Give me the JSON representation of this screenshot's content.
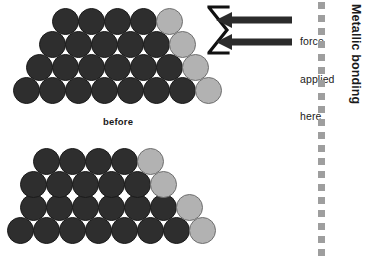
{
  "figure": {
    "title_side_label": "Metallic bonding",
    "annotation": {
      "force_line_1": "force",
      "force_line_2": "applied",
      "force_line_3": "here",
      "bracket_icon": "bracket-icon",
      "arrow_top_icon": "arrow-left-icon",
      "arrow_bottom_icon": "arrow-left-icon"
    },
    "panels": [
      {
        "id": "before",
        "caption": "before",
        "rows": [
          {
            "y": 8,
            "x": 52,
            "colors": [
              "dark",
              "dark",
              "dark",
              "dark",
              "light"
            ]
          },
          {
            "y": 31,
            "x": 39,
            "colors": [
              "dark",
              "dark",
              "dark",
              "dark",
              "dark",
              "light"
            ]
          },
          {
            "y": 54,
            "x": 26,
            "colors": [
              "dark",
              "dark",
              "dark",
              "dark",
              "dark",
              "dark",
              "light"
            ]
          },
          {
            "y": 77,
            "x": 13,
            "colors": [
              "dark",
              "dark",
              "dark",
              "dark",
              "dark",
              "dark",
              "dark",
              "light"
            ]
          }
        ]
      },
      {
        "id": "after",
        "caption": "",
        "rows": [
          {
            "y": 148,
            "x": 33,
            "colors": [
              "dark",
              "dark",
              "dark",
              "dark",
              "light"
            ]
          },
          {
            "y": 171,
            "x": 20,
            "colors": [
              "dark",
              "dark",
              "dark",
              "dark",
              "dark",
              "light"
            ]
          },
          {
            "y": 194,
            "x": 20,
            "colors": [
              "dark",
              "dark",
              "dark",
              "dark",
              "dark",
              "dark",
              "light"
            ]
          },
          {
            "y": 217,
            "x": 7,
            "colors": [
              "dark",
              "dark",
              "dark",
              "dark",
              "dark",
              "dark",
              "dark",
              "light"
            ]
          }
        ]
      }
    ],
    "atom_diameter": 27,
    "atom_step_x": 26,
    "colors": {
      "atom_dark": "#2e2e2e",
      "atom_light": "#b2b2b2",
      "divider_dot": "#9e9e9e",
      "ink": "#1a1a1a",
      "background": "#ffffff"
    },
    "divider": {
      "x": 318,
      "dot_count": 20,
      "dot_spacing": 13,
      "start_y": 2
    }
  }
}
